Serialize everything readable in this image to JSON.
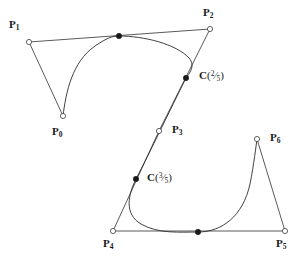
{
  "figure": {
    "background_color": "#ffffff",
    "line_color": "#3c3c3c",
    "curve_color": "#2b2b2b",
    "marker_fill": "#1a1a1a",
    "marker_hollow_fill": "#ffffff",
    "width": 307,
    "height": 260
  },
  "control_points": [
    {
      "id": "P0",
      "label": "P",
      "subscript": "0",
      "x": 63,
      "y": 116,
      "label_x": 52,
      "label_y": 126,
      "marker": "open-circle"
    },
    {
      "id": "P1",
      "label": "P",
      "subscript": "1",
      "x": 29,
      "y": 42,
      "label_x": 9,
      "label_y": 19,
      "marker": "open-circle"
    },
    {
      "id": "P2",
      "label": "P",
      "subscript": "2",
      "x": 210,
      "y": 29,
      "label_x": 203,
      "label_y": 7,
      "marker": "open-circle"
    },
    {
      "id": "P3",
      "label": "P",
      "subscript": "3",
      "x": 159,
      "y": 131,
      "label_x": 172,
      "label_y": 124,
      "marker": "open-circle"
    },
    {
      "id": "P4",
      "label": "P",
      "subscript": "4",
      "x": 113,
      "y": 231,
      "label_x": 103,
      "label_y": 238,
      "marker": "open-circle"
    },
    {
      "id": "P5",
      "label": "P",
      "subscript": "5",
      "x": 285,
      "y": 231,
      "label_x": 276,
      "label_y": 238,
      "marker": "open-circle"
    },
    {
      "id": "P6",
      "label": "P",
      "subscript": "6",
      "x": 257,
      "y": 139,
      "label_x": 270,
      "label_y": 132,
      "marker": "open-circle"
    }
  ],
  "curve_points": [
    {
      "id": "knot-a",
      "x": 119,
      "y": 36,
      "marker": "filled-dot",
      "label": null
    },
    {
      "id": "knot-b",
      "x": 198,
      "y": 232,
      "marker": "filled-dot",
      "label": null
    }
  ],
  "parameter_points": [
    {
      "id": "C25",
      "x": 186,
      "y": 78,
      "marker": "filled-dot",
      "label": "C",
      "numerator": "2",
      "denominator": "5",
      "label_x": 199,
      "label_y": 70
    },
    {
      "id": "C35",
      "x": 136,
      "y": 179,
      "marker": "filled-dot",
      "label": "C",
      "numerator": "3",
      "denominator": "5",
      "label_x": 147,
      "label_y": 172
    }
  ],
  "polygon_path": "M 63,116 L 29,42 L 210,29 L 159,131 L 113,231 L 285,231 L 257,139",
  "curve_path": "M 63,116 C 66,92 72,62 95,46 C 107,38 112,36 119,36 C 144,36 176,44 189,58 C 196,66 189,74 186,78 C 170,110 150,152 136,179 C 128,195 124,214 141,224 C 158,234 180,232 198,232 C 222,232 243,216 250,184 C 254,164 256,146 257,139"
}
